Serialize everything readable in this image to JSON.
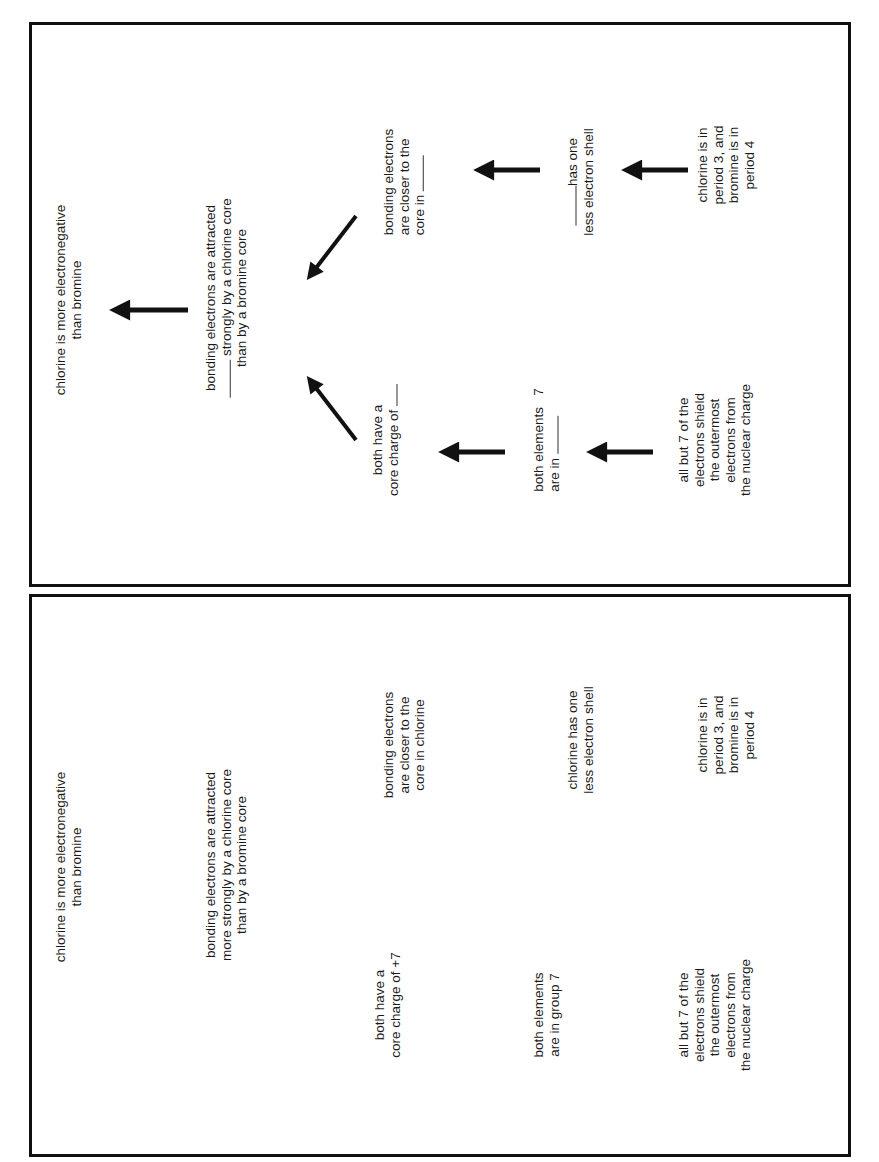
{
  "panels": [
    {
      "id": "worksheet-blank",
      "title": [
        "chlorine is more electronegative",
        "than bromine"
      ],
      "main": [
        "bonding electrons are attracted",
        "___ strongly by a chlorine core",
        "than by a bromine core"
      ],
      "main_lines": {
        "l1": "bonding electrons are attracted",
        "l2_blank": true,
        "l2": "strongly by a chlorine core",
        "l3": "than by a bromine core"
      },
      "upper_branch": {
        "closer": {
          "l1": "bonding electrons",
          "l2": "are closer to the",
          "l3": "core in"
        },
        "shell": {
          "l1": "has one",
          "l2": "less electron shell"
        },
        "period": {
          "l1": "chlorine is in",
          "l2": "period 3, and",
          "l3": "bromine is in",
          "l4": "period 4"
        }
      },
      "lower_branch": {
        "charge": {
          "l1": "both have a",
          "l2": "core charge of"
        },
        "group": {
          "l1": "both elements",
          "l2": "are in",
          "l2_suffix": "7"
        },
        "shield": {
          "l1": "all but 7 of the",
          "l2": "electrons shield",
          "l3": "the outermost",
          "l4": "electrons from",
          "l5": "the nuclear charge"
        }
      }
    },
    {
      "id": "worksheet-answers",
      "main_lines": {
        "l1": "bonding electrons are attracted",
        "l2": "more strongly by a chlorine core",
        "l3": "than by a bromine core"
      },
      "title": {
        "l1": "chlorine is more electronegative",
        "l2": "than bromine"
      },
      "upper_branch": {
        "closer": {
          "l1": "bonding electrons",
          "l2": "are closer to the",
          "l3": "core in chlorine"
        },
        "shell": {
          "l1": "chlorine has one",
          "l2": "less electron shell"
        },
        "period": {
          "l1": "chlorine is in",
          "l2": "period 3, and",
          "l3": "bromine is in",
          "l4": "period 4"
        }
      },
      "lower_branch": {
        "charge": {
          "l1": "both have a",
          "l2": "core charge of +7"
        },
        "group": {
          "l1": "both elements",
          "l2": "are in group 7"
        },
        "shield": {
          "l1": "all but 7 of the",
          "l2": "electrons shield",
          "l3": "the outermost",
          "l4": "electrons from",
          "l5": "the nuclear charge"
        }
      }
    }
  ],
  "top_title": {
    "l1": "chlorine is more electronegative",
    "l2": "than bromine"
  },
  "colors": {
    "ink": "#111111",
    "text": "#1a1a1a",
    "background": "#ffffff"
  }
}
